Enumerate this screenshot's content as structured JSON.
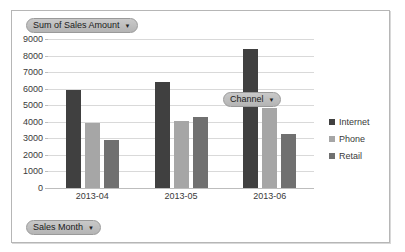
{
  "chart": {
    "value_field": {
      "label": "Sum of Sales Amount",
      "caret": "▼"
    },
    "row_field": {
      "label": "Sales Month",
      "caret": "▼"
    },
    "legend_field": {
      "label": "Channel",
      "caret": "▼"
    }
  },
  "chart_data": {
    "type": "bar",
    "title": "Sum of Sales Amount",
    "xlabel": "Sales Month",
    "ylabel": "",
    "categories": [
      "2013-04",
      "2013-05",
      "2013-06"
    ],
    "series": [
      {
        "name": "Internet",
        "color": "#404040",
        "values": [
          5950,
          6400,
          8400
        ]
      },
      {
        "name": "Phone",
        "color": "#a6a6a6",
        "values": [
          3950,
          4050,
          4850
        ]
      },
      {
        "name": "Retail",
        "color": "#707070",
        "values": [
          2900,
          4300,
          3250
        ]
      }
    ],
    "ylim": [
      0,
      9000
    ],
    "ytick_step": 1000,
    "ytick_labels": [
      "9000",
      "8000",
      "7000",
      "6000",
      "5000",
      "4000",
      "3000",
      "2000",
      "1000",
      "0"
    ],
    "grid": true,
    "legend_position": "right",
    "legend_title": "Channel"
  }
}
